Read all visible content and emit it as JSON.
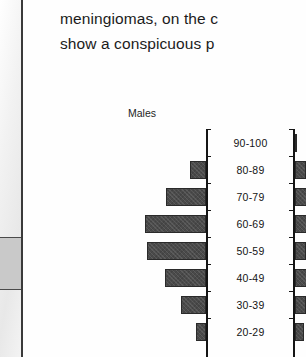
{
  "document": {
    "body_text_lines": [
      "meningiomas, on the c",
      "show a conspicuous p"
    ]
  },
  "chart_data": {
    "type": "bar",
    "title": "Males",
    "orientation": "horizontal-pyramid",
    "xlabel": "",
    "ylabel": "",
    "grid": false,
    "legend": "none",
    "categories": [
      "90-100",
      "80-89",
      "70-79",
      "60-69",
      "50-59",
      "40-49",
      "30-39",
      "20-29"
    ],
    "series": [
      {
        "name": "Males",
        "values": [
          0,
          16,
          40,
          61,
          59,
          41,
          25,
          10
        ]
      },
      {
        "name": "Females",
        "values": [
          2,
          11,
          13,
          12,
          11,
          12,
          11,
          9
        ]
      }
    ],
    "bar_pixel_widths_male": [
      0,
      16,
      40,
      61,
      59,
      41,
      25,
      10
    ],
    "bar_pixel_widths_female": [
      2,
      11,
      13,
      12,
      11,
      12,
      11,
      9
    ],
    "axis_color": "#151515",
    "bar_color": "#4a4a4a"
  },
  "scan_artifacts": {
    "edge_block_color": "#c9c9c9",
    "edge_rule_color": "#3a3a3a"
  }
}
